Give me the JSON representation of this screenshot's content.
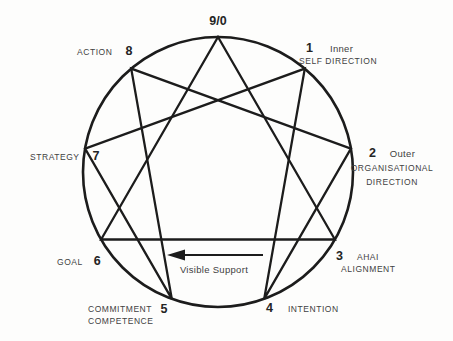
{
  "figure": {
    "type": "enneagram-process-diagram",
    "nodes": {
      "n9": {
        "number": "9/0"
      },
      "n1": {
        "number": "1",
        "line1": "Inner",
        "line2": "SELF DIRECTION"
      },
      "n2": {
        "number": "2",
        "line1": "Outer",
        "line2": "ORGANISATIONAL",
        "line3": "DIRECTION"
      },
      "n3": {
        "number": "3",
        "line1": "AHAI",
        "line2": "ALIGNMENT"
      },
      "n4": {
        "number": "4",
        "label": "INTENTION"
      },
      "n5": {
        "number": "5",
        "line1": "COMMITMENT",
        "line2": "COMPETENCE"
      },
      "n6": {
        "number": "6",
        "label": "GOAL"
      },
      "n7": {
        "number": "7",
        "label": "STRATEGY"
      },
      "n8": {
        "number": "8",
        "label": "ACTION"
      }
    },
    "arrow": {
      "label": "Visible Support",
      "direction": "left"
    },
    "connections": {
      "circle_order": [
        "9/0",
        "1",
        "2",
        "3",
        "4",
        "5",
        "6",
        "7",
        "8"
      ],
      "triangle": [
        "9/0",
        "3",
        "6"
      ],
      "hexad": [
        "1",
        "4",
        "2",
        "8",
        "5",
        "7"
      ]
    },
    "colors": {
      "line": "#1c1c1c",
      "text": "#414141",
      "background": "#fdfdfc"
    }
  }
}
